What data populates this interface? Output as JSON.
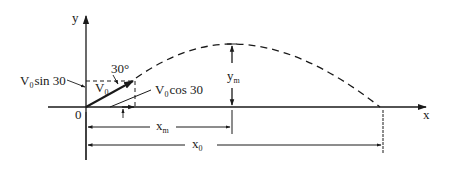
{
  "diagram": {
    "type": "projectile-motion",
    "axes": {
      "y_label": "y",
      "x_label": "x",
      "origin_label": "0"
    },
    "launch": {
      "angle_label": "30°",
      "velocity": {
        "main": "V",
        "sub": "0"
      },
      "vertical_component": {
        "main": "V",
        "sub": "0",
        "rest": "sin 30"
      },
      "horizontal_component": {
        "main": "V",
        "sub": "0",
        "rest": "cos 30"
      }
    },
    "dimensions": {
      "max_height": {
        "main": "y",
        "sub": "m"
      },
      "horizontal_to_peak": {
        "main": "x",
        "sub": "m"
      },
      "range": {
        "main": "x",
        "sub": "0"
      }
    },
    "colors": {
      "ink": "#1a1a1a",
      "background": "#ffffff"
    }
  }
}
